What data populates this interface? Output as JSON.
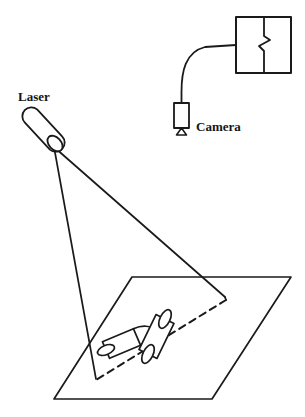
{
  "figure": {
    "type": "technical-line-diagram",
    "background_color": "#ffffff",
    "ink_color": "#1a1a1a",
    "width": 305,
    "height": 417
  },
  "labels": {
    "laser": "Laser",
    "camera": "Camera"
  },
  "label_positions": {
    "laser": {
      "x": 18,
      "y": 101
    },
    "camera": {
      "x": 196,
      "y": 131
    }
  },
  "parts": {
    "laser_emitter": {
      "name": "Laser",
      "shape": "tilted-capsule-cylinder",
      "axis_start": {
        "x": 31,
        "y": 116
      },
      "axis_end": {
        "x": 57,
        "y": 143
      },
      "radius": 9,
      "aperture_ellipse": {
        "cx": 56,
        "cy": 144,
        "rx": 9,
        "ry": 6.5,
        "rotation": 45
      }
    },
    "beam": {
      "name": "laser-light-plane",
      "apex": {
        "x": 54,
        "y": 147
      },
      "left_edge_end": {
        "x": 96,
        "y": 378
      },
      "right_edge_end": {
        "x": 225,
        "y": 297
      }
    },
    "stripe": {
      "name": "projected-laser-stripe",
      "style": "dashed",
      "start": {
        "x": 225,
        "y": 299
      },
      "end": {
        "x": 96,
        "y": 379
      }
    },
    "ground_plane": {
      "name": "ground-plane",
      "shape": "parallelogram",
      "corners": [
        {
          "x": 132,
          "y": 277
        },
        {
          "x": 291,
          "y": 277
        },
        {
          "x": 212,
          "y": 399
        },
        {
          "x": 54,
          "y": 399
        }
      ]
    },
    "object_cylinder_left": {
      "name": "cylinder-object-left",
      "axis_start": {
        "x": 106,
        "y": 350
      },
      "axis_end": {
        "x": 137,
        "y": 337
      },
      "radius": 9
    },
    "object_cylinder_right": {
      "name": "cylinder-object-right",
      "axis_start": {
        "x": 148,
        "y": 354
      },
      "axis_end": {
        "x": 165,
        "y": 319
      },
      "radius": 10
    },
    "camera": {
      "name": "Camera",
      "body": {
        "x": 174,
        "y": 103,
        "width": 15,
        "height": 25
      },
      "tripod_triangle": {
        "cx": 181.5,
        "cy": 133,
        "half_width": 5,
        "height": 6
      },
      "cable_top": {
        "x": 181.5,
        "y": 103
      }
    },
    "computer": {
      "name": "computer-workstation",
      "box": {
        "x": 236,
        "y": 17,
        "width": 55,
        "height": 56
      },
      "divider_x": 264,
      "zigzag_notch": true
    },
    "cable": {
      "name": "camera-to-computer-cable",
      "from": {
        "x": 181.5,
        "y": 90
      },
      "to": {
        "x": 236,
        "y": 46
      }
    }
  }
}
